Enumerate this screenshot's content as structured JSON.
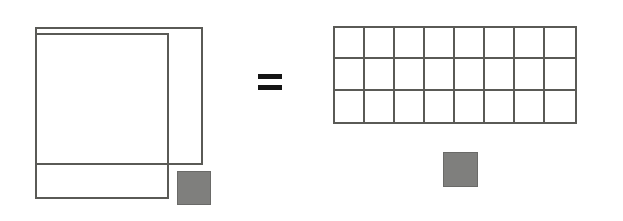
{
  "figure": {
    "relation_symbol": "=",
    "colors": {
      "outline": "#5a5a56",
      "fill_gray": "#7f7f7d",
      "background": "#ffffff",
      "equals": "#141414"
    },
    "left_diagram": {
      "name": "overlapping-squares",
      "description": "Two overlapping outlined squares with a small filled gray square at the lower right",
      "shapes": [
        {
          "name": "large-square-a",
          "kind": "outline-rectangle",
          "x": 35,
          "y": 27,
          "width": 168,
          "height": 138,
          "label": ""
        },
        {
          "name": "large-square-b",
          "kind": "outline-rectangle",
          "x": 35,
          "y": 33,
          "width": 134,
          "height": 166,
          "label": ""
        },
        {
          "name": "small-gray-square-left",
          "kind": "filled-square",
          "x": 177,
          "y": 171,
          "width": 34,
          "height": 34,
          "label": ""
        }
      ]
    },
    "right_diagram": {
      "name": "rectangle-grid",
      "description": "Rectangle subdivided into a grid of unit squares",
      "grid": {
        "x": 333,
        "y": 26,
        "width": 244,
        "height": 98,
        "columns": 8,
        "rows": 3,
        "cell_count": 24
      },
      "shapes": [
        {
          "name": "small-gray-square-right",
          "kind": "filled-square",
          "x": 443,
          "y": 152,
          "width": 35,
          "height": 35,
          "label": ""
        }
      ]
    },
    "equals": {
      "name": "equals-sign",
      "x": 258,
      "y": 74,
      "width": 24,
      "height": 16,
      "text": "="
    }
  },
  "chart_data": {
    "type": "diagram",
    "left": {
      "squares": [
        {
          "id": "A",
          "x": 35,
          "y": 27,
          "w": 168,
          "h": 138
        },
        {
          "id": "B",
          "x": 35,
          "y": 33,
          "w": 134,
          "h": 166
        }
      ],
      "gray_unit_square": {
        "x": 177,
        "y": 171,
        "w": 34,
        "h": 34
      }
    },
    "right": {
      "grid_columns": 8,
      "grid_rows": 3,
      "unit_cells": 24,
      "gray_unit_square": {
        "x": 443,
        "y": 152,
        "w": 35,
        "h": 35
      }
    },
    "relation": "="
  }
}
